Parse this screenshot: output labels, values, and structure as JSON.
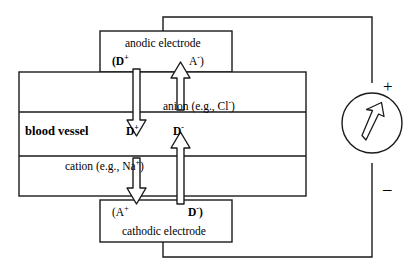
{
  "figure": {
    "electrodes": {
      "anodic": {
        "name": "anodic-electrode",
        "label": "anodic electrode",
        "species_left": "(D",
        "species_left_sup": "+",
        "species_right": "A",
        "species_right_sup": "-",
        "species_right_close": ")"
      },
      "cathodic": {
        "name": "cathodic-electrode",
        "label": "cathodic electrode",
        "species_left": "(A",
        "species_left_sup": "+",
        "species_right": "D",
        "species_right_sup": "-",
        "species_right_close": ")"
      }
    },
    "vessel": {
      "label": "blood vessel",
      "anion_label": "anion (e.g., Cl",
      "anion_sup": "-",
      "anion_close": ")",
      "cation_label": "cation (e.g., Na",
      "cation_sup": "+",
      "cation_close": ")",
      "drug_cation": "D",
      "drug_cation_sup": "+",
      "drug_anion": "D",
      "drug_anion_sup": "-"
    },
    "source": {
      "name": "current-source",
      "plus_sign": "+",
      "minus_sign": "–",
      "symbol": "up-right-arrow"
    },
    "colors": {
      "stroke": "#1a1a1a",
      "fill": "#ffffff",
      "text": "#000000"
    }
  }
}
